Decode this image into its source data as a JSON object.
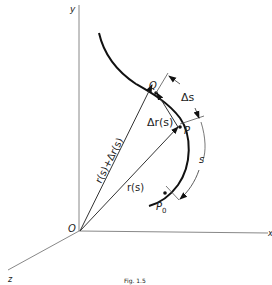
{
  "diagram": {
    "axes": {
      "y_label": "y",
      "x_label": "x",
      "z_label": "z",
      "origin_label": "O"
    },
    "points": {
      "Q": "Q",
      "P": "P",
      "P0": "P",
      "P0_sub": "0"
    },
    "vectors": {
      "r_s": "r(s)",
      "r_plus_dr": "r(s)+Δr(s)",
      "delta_r": "Δr(s)"
    },
    "arc_lengths": {
      "delta_s": "Δs",
      "s": "s"
    },
    "caption": "Fig. 1.5"
  }
}
